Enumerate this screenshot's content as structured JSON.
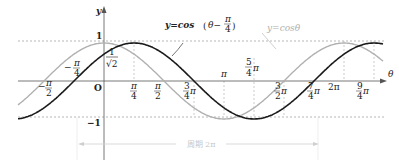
{
  "chart_data": {
    "type": "line",
    "title": "",
    "xlabel": "θ",
    "ylabel": "y",
    "ylim": [
      -1,
      1
    ],
    "xlim": [
      -0.5,
      2.5
    ],
    "xlim_units": "π",
    "grid": false,
    "reference_lines": {
      "y": [
        1,
        -1
      ],
      "style": "dashed"
    },
    "x_ticks": [
      "-π/2",
      "-π/4",
      "O",
      "π/4",
      "π/2",
      "3/4π",
      "π",
      "5/4π",
      "3/2π",
      "7/4π",
      "2π",
      "9/4π"
    ],
    "y_ticks": [
      "1",
      "1/√2",
      "-1"
    ],
    "series": [
      {
        "name": "y=cos(θ-π/4)",
        "color": "#1a1a1a",
        "style": "solid-thick",
        "formula": "cos(θ - π/4)",
        "key_points": [
          {
            "x": "π/4",
            "y": 1
          },
          {
            "x": "3/4π",
            "y": 0
          },
          {
            "x": "5/4π",
            "y": -1
          },
          {
            "x": "7/4π",
            "y": 0
          },
          {
            "x": "9/4π",
            "y": 1
          },
          {
            "x": "0",
            "y": "1/√2"
          },
          {
            "x": "-π/4",
            "y": 0
          }
        ]
      },
      {
        "name": "y=cosθ",
        "color": "#b0b0b0",
        "style": "solid",
        "formula": "cos(θ)",
        "key_points": [
          {
            "x": "0",
            "y": 1
          },
          {
            "x": "π/2",
            "y": 0
          },
          {
            "x": "π",
            "y": -1
          },
          {
            "x": "3/2π",
            "y": 0
          },
          {
            "x": "2π",
            "y": 1
          },
          {
            "x": "-π/2",
            "y": 0
          }
        ]
      }
    ],
    "annotations": [
      {
        "text": "y=cos(θ-π/4)",
        "target": "black curve"
      },
      {
        "text": "y=cosθ",
        "target": "gray curve"
      },
      {
        "text": "周期 2π",
        "type": "double-arrow",
        "from": "-π/4",
        "to": "7/4π"
      }
    ]
  },
  "labels": {
    "y_axis": "y",
    "x_axis": "θ",
    "origin": "O",
    "one": "1",
    "minus_one": "−1",
    "inv_sqrt2_num": "1",
    "inv_sqrt2_den": "√2",
    "series_black": {
      "prefix": "y=cos",
      "paren_open": "(",
      "theta": "θ−",
      "num": "π",
      "den": "4",
      "paren_close": ")"
    },
    "series_gray": "y=cosθ",
    "period": "周期 2π",
    "ticks": {
      "neg_pi_2": {
        "sign": "−",
        "num": "π",
        "den": "2"
      },
      "neg_pi_4": {
        "sign": "−",
        "num": "π",
        "den": "4"
      },
      "pi_4": {
        "num": "π",
        "den": "4"
      },
      "pi_2": {
        "num": "π",
        "den": "2"
      },
      "three_pi_4": {
        "num": "3",
        "den": "4",
        "suffix": "π"
      },
      "pi": "π",
      "five_pi_4": {
        "num": "5",
        "den": "4",
        "suffix": "π"
      },
      "three_pi_2": {
        "num": "3",
        "den": "2",
        "suffix": "π"
      },
      "seven_pi_4": {
        "num": "7",
        "den": "4",
        "suffix": "π"
      },
      "two_pi": "2π",
      "nine_pi_4": {
        "num": "9",
        "den": "4",
        "suffix": "π"
      }
    }
  },
  "colors": {
    "black_curve": "#1a1a1a",
    "gray_curve": "#b0b0b0",
    "axis": "#555555",
    "dashed": "#999999"
  }
}
